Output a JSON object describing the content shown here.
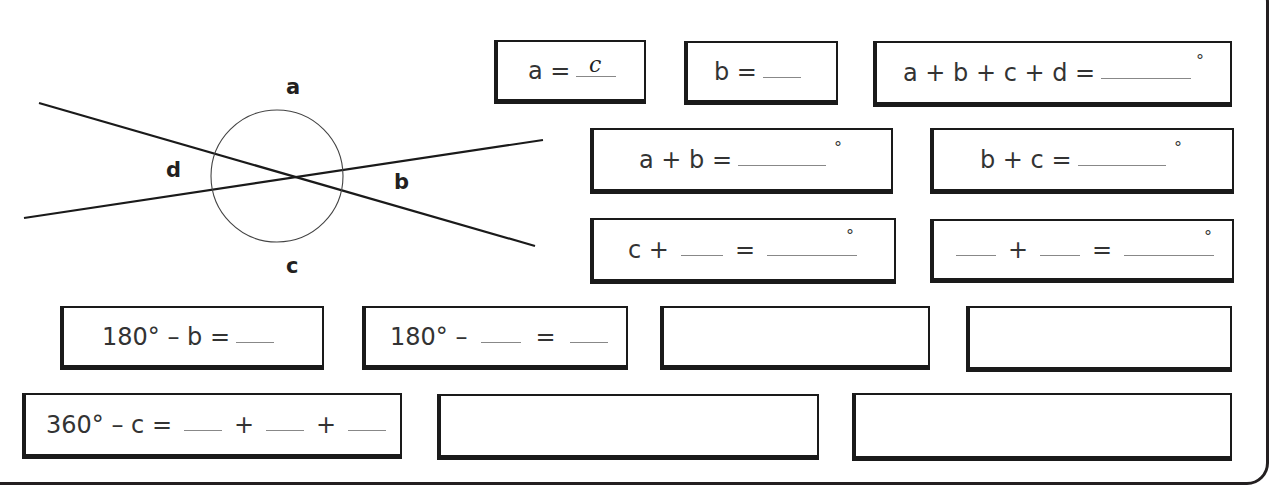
{
  "diagram": {
    "labels": {
      "a": "a",
      "b": "b",
      "c": "c",
      "d": "d"
    }
  },
  "boxes": [
    {
      "id": "box-a",
      "parts": [
        "a ="
      ],
      "answer": "c",
      "degree": ""
    },
    {
      "id": "box-b",
      "parts": [
        "b ="
      ],
      "answer": "",
      "degree": ""
    },
    {
      "id": "box-sum-all",
      "parts": [
        "a + b + c + d ="
      ],
      "answer": "",
      "degree": "°"
    },
    {
      "id": "box-a-plus-b",
      "parts": [
        "a + b ="
      ],
      "answer": "",
      "degree": "°"
    },
    {
      "id": "box-b-plus-c",
      "parts": [
        "b + c ="
      ],
      "answer": "",
      "degree": "°"
    },
    {
      "id": "box-c-plus",
      "parts": [
        "c +",
        "="
      ],
      "answer": "",
      "degree": "°"
    },
    {
      "id": "box-blank-plus",
      "parts": [
        "+",
        "="
      ],
      "answer": "",
      "degree": "°"
    },
    {
      "id": "box-180-minus-b",
      "parts": [
        "180° – b ="
      ],
      "answer": "",
      "degree": ""
    },
    {
      "id": "box-180-minus",
      "parts": [
        "180° –",
        "="
      ],
      "answer": "",
      "degree": ""
    },
    {
      "id": "box-empty-1",
      "parts": [],
      "answer": "",
      "degree": ""
    },
    {
      "id": "box-empty-2",
      "parts": [],
      "answer": "",
      "degree": ""
    },
    {
      "id": "box-360-minus-c",
      "parts": [
        "360° – c =",
        "+",
        "+"
      ],
      "answer": "",
      "degree": ""
    },
    {
      "id": "box-empty-3",
      "parts": [],
      "answer": "",
      "degree": ""
    },
    {
      "id": "box-empty-4",
      "parts": [],
      "answer": "",
      "degree": ""
    }
  ]
}
